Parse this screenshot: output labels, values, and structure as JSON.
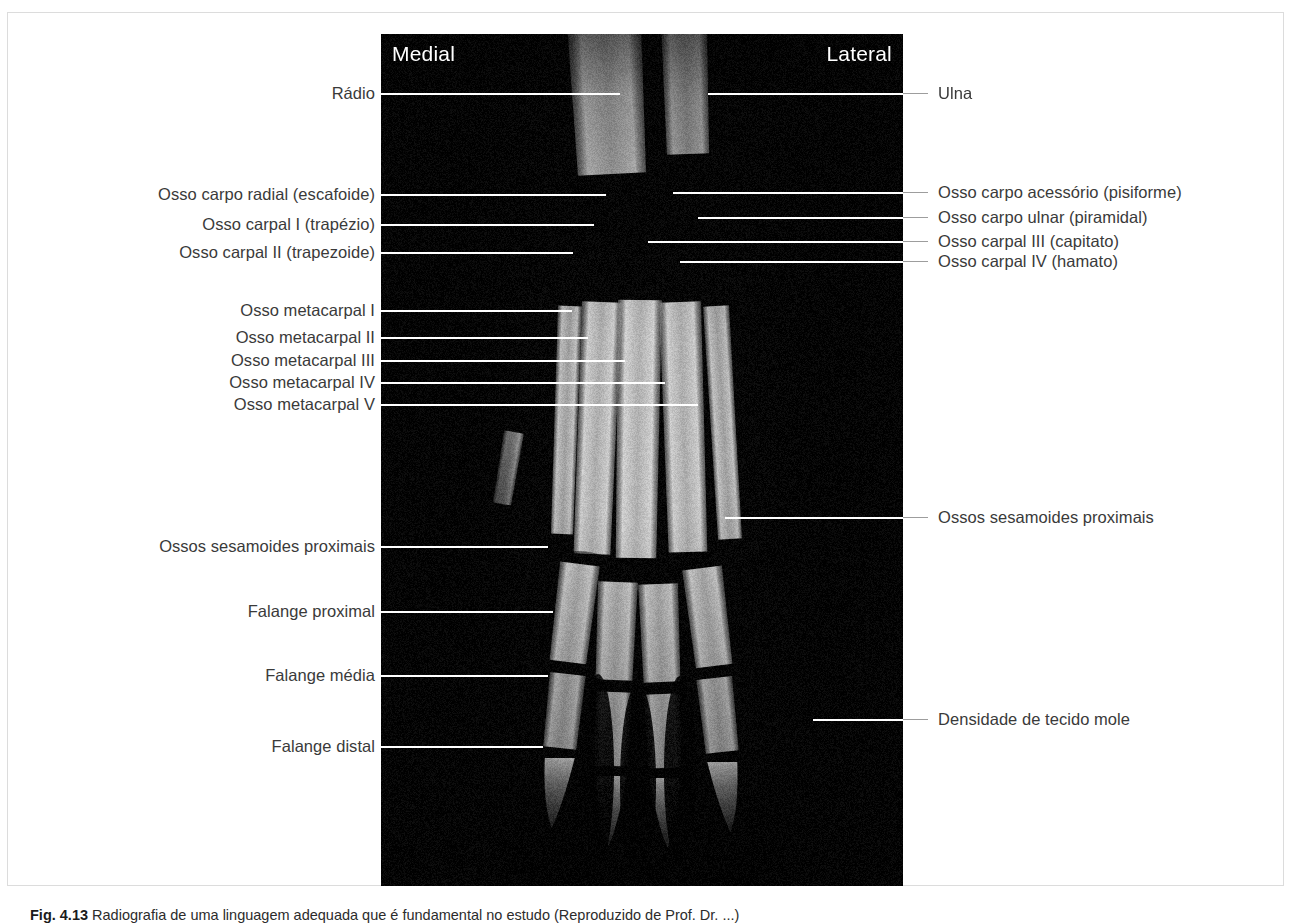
{
  "figure": {
    "orientation": {
      "medial": "Medial",
      "lateral": "Lateral"
    },
    "caption_number": "Fig. 4.13",
    "caption_text": "Radiografia de uma linguagem adequada que é fundamental no estudo (Reproduzido de Prof. Dr. ...)",
    "image_alt": "Radiografia dorsopalmar do carpo e metacarpo"
  },
  "labels_left": [
    {
      "id": "radio",
      "text": "Rádio",
      "y": 80,
      "line_end": 612,
      "text_right": 367
    },
    {
      "id": "escafoide",
      "text": "Osso carpo radial (escafoide)",
      "y": 181,
      "line_end": 598,
      "text_right": 367
    },
    {
      "id": "trapezio",
      "text": "Osso carpal I (trapézio)",
      "y": 211,
      "line_end": 586,
      "text_right": 367
    },
    {
      "id": "trapezoide",
      "text": "Osso carpal II (trapezoide)",
      "y": 239,
      "line_end": 565,
      "text_right": 367
    },
    {
      "id": "mc1",
      "text": "Osso metacarpal I",
      "y": 297,
      "line_end": 564,
      "text_right": 367
    },
    {
      "id": "mc2",
      "text": "Osso metacarpal II",
      "y": 324,
      "line_end": 580,
      "text_right": 367
    },
    {
      "id": "mc3",
      "text": "Osso metacarpal III",
      "y": 347,
      "line_end": 617,
      "text_right": 367
    },
    {
      "id": "mc4",
      "text": "Osso metacarpal IV",
      "y": 369,
      "line_end": 657,
      "text_right": 367
    },
    {
      "id": "mc5",
      "text": "Osso metacarpal V",
      "y": 391,
      "line_end": 690,
      "text_right": 367
    },
    {
      "id": "sesam-left",
      "text": "Ossos sesamoides proximais",
      "y": 533,
      "line_end": 540,
      "text_right": 367
    },
    {
      "id": "fal-prox",
      "text": "Falange proximal",
      "y": 598,
      "line_end": 545,
      "text_right": 367
    },
    {
      "id": "fal-media",
      "text": "Falange média",
      "y": 662,
      "line_end": 540,
      "text_right": 367
    },
    {
      "id": "fal-distal",
      "text": "Falange distal",
      "y": 733,
      "line_end": 535,
      "text_right": 367
    }
  ],
  "labels_right": [
    {
      "id": "ulna",
      "text": "Ulna",
      "y": 80,
      "line_start": 700,
      "text_left": 930
    },
    {
      "id": "pisiforme",
      "text": "Osso carpo acessório (pisiforme)",
      "y": 179,
      "line_start": 665,
      "text_left": 930
    },
    {
      "id": "piramidal",
      "text": "Osso carpo ulnar (piramidal)",
      "y": 204,
      "line_start": 690,
      "text_left": 930
    },
    {
      "id": "capitato",
      "text": "Osso carpal III (capitato)",
      "y": 228,
      "line_start": 640,
      "text_left": 930
    },
    {
      "id": "hamato",
      "text": "Osso carpal IV (hamato)",
      "y": 248,
      "line_start": 672,
      "text_left": 930
    },
    {
      "id": "sesam-right",
      "text": "Ossos sesamoides proximais",
      "y": 504,
      "line_start": 717,
      "text_left": 930
    },
    {
      "id": "tecido-mole",
      "text": "Densidade de tecido mole",
      "y": 706,
      "line_start": 805,
      "text_left": 930
    }
  ]
}
